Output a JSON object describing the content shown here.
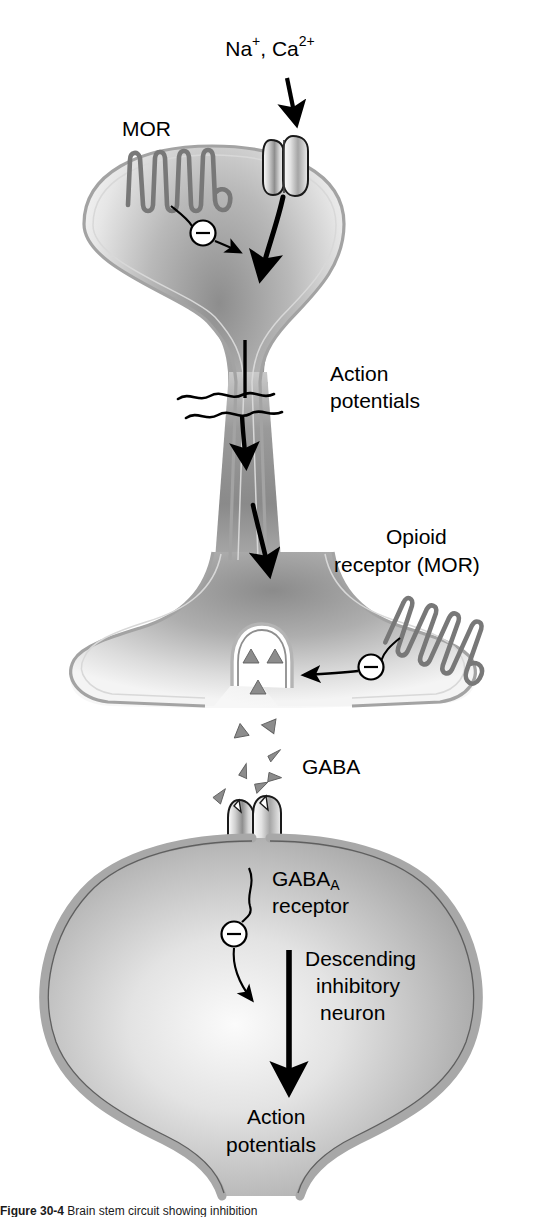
{
  "figure": {
    "domain": "Diagram",
    "background_color": "#ffffff",
    "ink_color": "#000000",
    "membrane_color": "#a8a8a8",
    "cytoplasm_light": "#f2f2f2",
    "cytoplasm_dark": "#8f8f8f",
    "gaba_triangle_color": "#8c8c8c"
  },
  "labels": {
    "ions": "Na+, Ca2+",
    "ions_parts": {
      "na": "Na",
      "na_sup": "+",
      "sep": ", ",
      "ca": "Ca",
      "ca_sup": "2+"
    },
    "mor_top": "MOR",
    "action_potentials_top_line1": "Action",
    "action_potentials_top_line2": "potentials",
    "opioid_receptor_line1": "Opioid",
    "opioid_receptor_line2": "receptor (MOR)",
    "gaba": "GABA",
    "gaba_a_receptor_line1_main": "GABA",
    "gaba_a_receptor_line1_sub": "A",
    "gaba_a_receptor_line2": "receptor",
    "descending_line1": "Descending",
    "descending_line2": "inhibitory",
    "descending_line3": "neuron",
    "action_potentials_bottom_line1": "Action",
    "action_potentials_bottom_line2": "potentials"
  },
  "caption": {
    "label": "Figure 30-4",
    "rest": "  Brain stem circuit showing inhibition",
    "clipped": true
  },
  "elements": {
    "ion_channel": "voltage-gated ion channel (two subunits)",
    "mor_receptor_top": "seven-transmembrane serpentine opioid receptor on presynaptic terminal",
    "mor_receptor_bottom": "seven-transmembrane serpentine opioid receptor on axon terminal",
    "vesicle": "synaptic vesicle containing GABA",
    "gaba_a_channel": "GABA-A ionotropic receptor channel",
    "inhibition_symbols": 3,
    "axon_break": "squiggle break indicating axon continues",
    "presynaptic_neuron": "GABAergic interneuron terminal",
    "postsynaptic_neuron": "descending inhibitory neuron soma"
  }
}
